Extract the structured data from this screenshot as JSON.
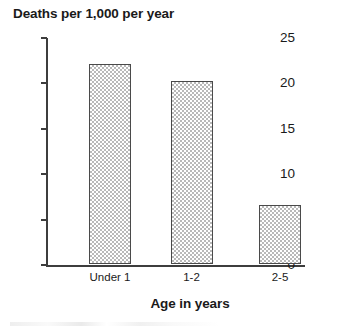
{
  "chart_data": {
    "type": "bar",
    "title": "Deaths per 1,000 per year",
    "xlabel": "Age in years",
    "ylabel": "",
    "categories": [
      "Under 1",
      "1-2",
      "2-5"
    ],
    "values": [
      22.0,
      20.2,
      6.5
    ],
    "ylim": [
      0,
      25
    ],
    "yticks": [
      0,
      5,
      10,
      15,
      20,
      25
    ],
    "ytick_labels": [
      "0",
      "5",
      "10",
      "15",
      "20",
      "25"
    ],
    "grid": false,
    "legend": false,
    "colors": {
      "bar_fill": "#b9b9b9",
      "bar_edge": "#4a4a4a",
      "axis": "#3d3d3d",
      "text": "#1a1a1a",
      "background": "#ffffff"
    }
  }
}
